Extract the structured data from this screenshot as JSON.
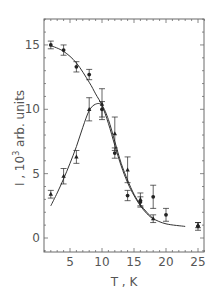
{
  "chart_data": {
    "type": "scatter",
    "title": "",
    "xlabel": "T , K",
    "ylabel": "I , 10³ arb. units",
    "ylabel_parts": {
      "prefix": "I , 10",
      "superscript": "3",
      "suffix": " arb. units"
    },
    "xlim": [
      1,
      26
    ],
    "ylim": [
      -1,
      17
    ],
    "xticks": [
      5,
      10,
      15,
      20,
      25
    ],
    "yticks": [
      0,
      5,
      10,
      15
    ],
    "grid": false,
    "legend": null,
    "series": [
      {
        "name": "circles",
        "marker": "circle",
        "x": [
          2,
          4,
          6,
          8,
          10,
          12,
          14,
          16,
          18,
          20,
          25
        ],
        "y": [
          15.0,
          14.6,
          13.3,
          12.7,
          10.0,
          6.6,
          3.3,
          2.8,
          3.2,
          1.8,
          0.9
        ],
        "yerr": [
          0.3,
          0.4,
          0.4,
          0.4,
          0.6,
          0.4,
          0.4,
          0.4,
          0.9,
          0.5,
          0.3
        ]
      },
      {
        "name": "triangles",
        "marker": "triangle",
        "x": [
          2,
          4,
          6,
          8,
          10,
          12,
          14,
          16,
          18,
          25
        ],
        "y": [
          3.4,
          4.8,
          6.3,
          10.0,
          10.4,
          8.1,
          5.3,
          3.0,
          1.5,
          1.0
        ],
        "yerr": [
          0.3,
          0.6,
          0.5,
          0.9,
          1.2,
          1.3,
          1.0,
          0.5,
          0.3,
          0.2
        ]
      }
    ],
    "fit_curves": [
      {
        "name": "fit-circles",
        "x": [
          2,
          4,
          6,
          8,
          9,
          10,
          11,
          12,
          13,
          14,
          15,
          16,
          17,
          18,
          20,
          23
        ],
        "y": [
          14.95,
          14.5,
          13.6,
          12.1,
          11.2,
          10.3,
          8.9,
          7.2,
          5.6,
          4.3,
          3.3,
          2.5,
          1.9,
          1.5,
          1.1,
          0.9
        ]
      },
      {
        "name": "fit-triangles",
        "x": [
          2,
          3,
          4,
          5,
          6,
          7,
          8,
          9,
          10,
          11,
          12,
          13,
          14,
          15,
          16,
          17,
          18
        ],
        "y": [
          2.5,
          3.5,
          4.6,
          5.8,
          7.1,
          8.6,
          9.9,
          10.4,
          10.3,
          9.2,
          7.5,
          5.8,
          4.5,
          3.4,
          2.6,
          2.0,
          1.5
        ]
      }
    ]
  },
  "colors": {
    "frame": "#6b6b6b",
    "curve": "#333333",
    "marker": "#222222",
    "text": "#555555"
  }
}
